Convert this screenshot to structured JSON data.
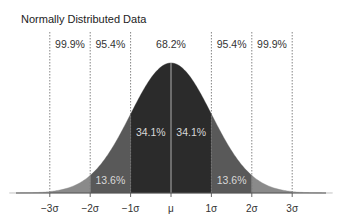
{
  "chart_data": {
    "type": "area",
    "title": "Normally Distributed Data",
    "xlabel": "",
    "ylabel": "",
    "distribution": "normal",
    "mean_label": "μ",
    "tick_labels": [
      "−3σ",
      "−2σ",
      "−1σ",
      "μ",
      "1σ",
      "2σ",
      "3σ"
    ],
    "tick_values": [
      -3,
      -2,
      -1,
      0,
      1,
      2,
      3
    ],
    "grid": false,
    "vertical_dotted_lines_at": [
      -3,
      -2,
      -1,
      1,
      2,
      3
    ],
    "center_line_at": 0,
    "regions": [
      {
        "from": -1,
        "to": 0,
        "label": "34.1%",
        "percent": 34.1,
        "color": "#2b2b2b"
      },
      {
        "from": 0,
        "to": 1,
        "label": "34.1%",
        "percent": 34.1,
        "color": "#2b2b2b"
      },
      {
        "from": -2,
        "to": -1,
        "label": "13.6%",
        "percent": 13.6,
        "color": "#595959"
      },
      {
        "from": 1,
        "to": 2,
        "label": "13.6%",
        "percent": 13.6,
        "color": "#595959"
      },
      {
        "from": -3,
        "to": -2,
        "label": "",
        "percent": 2.1,
        "color": "#8a8a8a"
      },
      {
        "from": 2,
        "to": 3,
        "label": "",
        "percent": 2.1,
        "color": "#8a8a8a"
      },
      {
        "from": -4,
        "to": -3,
        "label": "",
        "percent": 0.1,
        "color": "#a8a8a8"
      },
      {
        "from": 3,
        "to": 4,
        "label": "",
        "percent": 0.1,
        "color": "#a8a8a8"
      }
    ],
    "top_annotations": [
      {
        "label": "99.9%",
        "between": [
          -3,
          -2
        ]
      },
      {
        "label": "95.4%",
        "between": [
          -2,
          -1
        ]
      },
      {
        "label": "68.2%",
        "between": [
          -1,
          1
        ]
      },
      {
        "label": "95.4%",
        "between": [
          1,
          2
        ]
      },
      {
        "label": "99.9%",
        "between": [
          2,
          3
        ]
      }
    ],
    "xlim": [
      -3.8,
      3.8
    ]
  }
}
